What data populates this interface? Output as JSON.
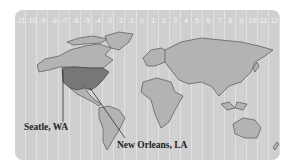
{
  "map": {
    "timezone_labels": [
      "-11",
      "-10",
      "-9",
      "-8",
      "-7",
      "-6",
      "-5",
      "-4",
      "-3",
      "-2",
      "-1",
      "0",
      "1",
      "2",
      "3",
      "4",
      "5",
      "6",
      "7",
      "8",
      "9",
      "10",
      "11",
      "12"
    ],
    "highlighted_region": "United States",
    "callouts": [
      {
        "label": "Seatle, WA"
      },
      {
        "label": "New Orleans, LA"
      }
    ],
    "colors": {
      "panel": "#cfcfcf",
      "land": "#b3b3b3",
      "highlight": "#777777",
      "outline": "#555555",
      "timezone_text": "#f4f4f4"
    }
  }
}
